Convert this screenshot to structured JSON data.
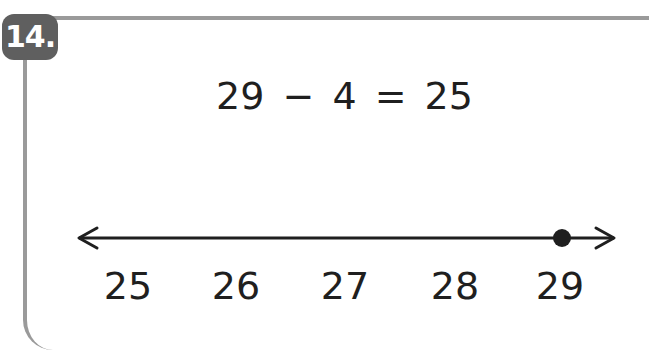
{
  "problem": {
    "number_label": "14.",
    "equation": "29 − 4 = 25"
  },
  "number_line": {
    "labels": [
      "25",
      "26",
      "27",
      "28",
      "29"
    ],
    "marked_point": "29",
    "arrows": "both ends"
  },
  "colors": {
    "frame": "#9a9a9a",
    "badge": "#5f5f5f",
    "ink": "#1f1f1f"
  }
}
